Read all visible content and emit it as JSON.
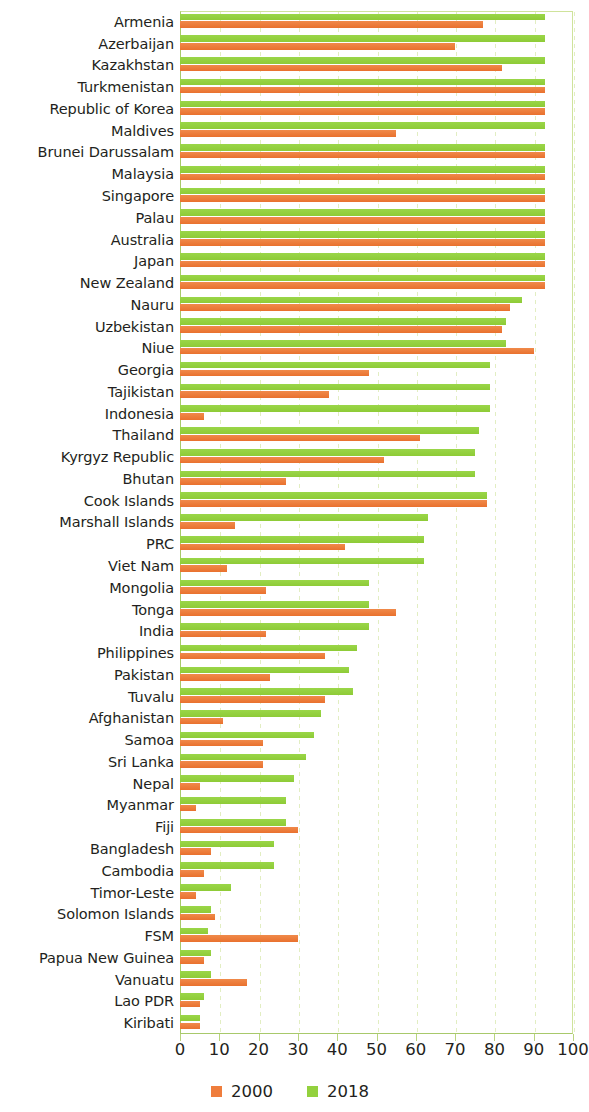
{
  "chart_data": {
    "type": "bar",
    "orientation": "horizontal",
    "title": "",
    "subtitle": "",
    "xlabel": "",
    "ylabel": "",
    "xlim": [
      0,
      100
    ],
    "xticks": [
      0,
      10,
      20,
      30,
      40,
      50,
      60,
      70,
      80,
      90,
      100
    ],
    "xtick_labels": [
      "0",
      "10",
      "20",
      "30",
      "40",
      "50",
      "60",
      "70",
      "80",
      "90",
      "100"
    ],
    "grid": true,
    "grid_axis": "x",
    "legend_position": "bottom",
    "colors": {
      "2000": "#ef7d3c",
      "2018": "#93d13e",
      "grid": "#e2eec2",
      "axis": "#a8c96b",
      "text": "#231f20"
    },
    "categories": [
      "Armenia",
      "Azerbaijan",
      "Kazakhstan",
      "Turkmenistan",
      "Republic of Korea",
      "Maldives",
      "Brunei Darussalam",
      "Malaysia",
      "Singapore",
      "Palau",
      "Australia",
      "Japan",
      "New Zealand",
      "Nauru",
      "Uzbekistan",
      "Niue",
      "Georgia",
      "Tajikistan",
      "Indonesia",
      "Thailand",
      "Kyrgyz Republic",
      "Bhutan",
      "Cook Islands",
      "Marshall Islands",
      "PRC",
      "Viet Nam",
      "Mongolia",
      "Tonga",
      "India",
      "Philippines",
      "Pakistan",
      "Tuvalu",
      "Afghanistan",
      "Samoa",
      "Sri Lanka",
      "Nepal",
      "Myanmar",
      "Fiji",
      "Bangladesh",
      "Cambodia",
      "Timor-Leste",
      "Solomon Islands",
      "FSM",
      "Papua New Guinea",
      "Vanuatu",
      "Lao PDR",
      "Kiribati"
    ],
    "series": [
      {
        "name": "2000",
        "color": "#ef7d3c",
        "values": [
          77,
          70,
          82,
          93,
          93,
          55,
          93,
          93,
          93,
          93,
          93,
          93,
          93,
          84,
          82,
          90,
          48,
          38,
          6,
          61,
          52,
          27,
          78,
          14,
          42,
          12,
          22,
          55,
          22,
          37,
          23,
          37,
          11,
          21,
          21,
          5,
          4,
          30,
          8,
          6,
          4,
          9,
          30,
          6,
          17,
          5,
          5
        ]
      },
      {
        "name": "2018",
        "color": "#93d13e",
        "values": [
          93,
          93,
          93,
          93,
          93,
          93,
          93,
          93,
          93,
          93,
          93,
          93,
          93,
          87,
          83,
          83,
          79,
          79,
          79,
          76,
          75,
          75,
          78,
          63,
          62,
          62,
          48,
          48,
          48,
          45,
          43,
          44,
          36,
          34,
          32,
          29,
          27,
          27,
          24,
          24,
          13,
          8,
          7,
          8,
          8,
          6,
          5
        ]
      }
    ]
  },
  "legend": {
    "items": [
      {
        "label": "2000",
        "color": "#ef7d3c"
      },
      {
        "label": "2018",
        "color": "#93d13e"
      }
    ]
  }
}
